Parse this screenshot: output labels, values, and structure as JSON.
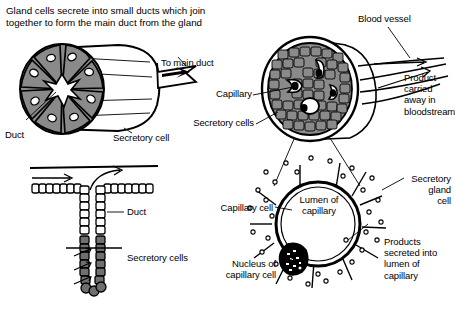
{
  "title": "Gland cells secrete into small ducts which join\ntogether to form the main duct from the gland",
  "colors": {
    "ink": "#000000",
    "cell_gray": "#8a8a8a",
    "cell_gray_dark": "#6f6f6f",
    "lumen_white": "#ffffff",
    "background": "#ffffff"
  },
  "panels": {
    "acinus": {
      "name": "Exocrine acinus",
      "labels": {
        "to_main_duct": "To main duct",
        "duct": "Duct",
        "secretory_cell": "Secretory cell"
      },
      "cell_count": 8
    },
    "tubular_gland": {
      "name": "Tubular gland",
      "labels": {
        "duct": "Duct",
        "secretory_cells": "Secretory cells"
      }
    },
    "endocrine_section": {
      "name": "Endocrine gland cross-section",
      "labels": {
        "blood_vessel": "Blood vessel",
        "product_carried": "Product\ncarried\naway in\nbloodstream",
        "capillary": "Capillary",
        "secretory_cells": "Secretory cells"
      },
      "capillary_count": 4
    },
    "capillary_detail": {
      "name": "Capillary detail",
      "labels": {
        "lumen_of_capillary": "Lumen of\ncapillary",
        "secretory_gland_cell": "Secretory\ngland\ncell",
        "capillary_cell": "Capillary cell",
        "nucleus_of_capillary_cell": "Nucleus of\ncapillary cell",
        "products_secreted": "Products\nsecreted into\nlumen of\ncapillary"
      }
    }
  }
}
